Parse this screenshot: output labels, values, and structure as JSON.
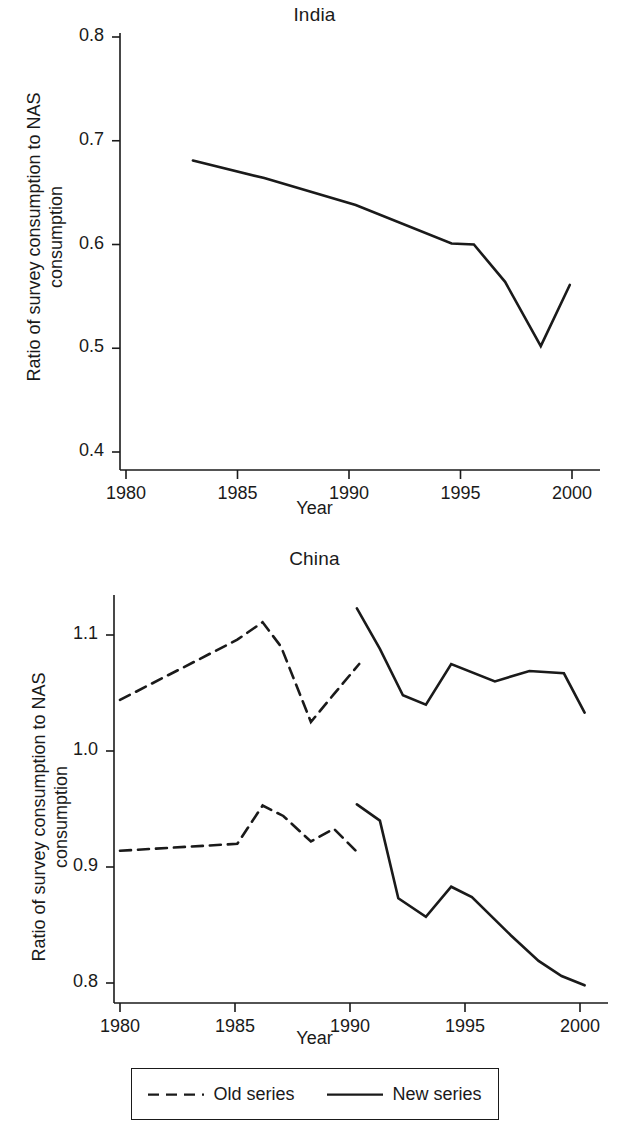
{
  "figure": {
    "ylabel": "Ratio of survey consumption to NAS\nconsumption",
    "xlabel": "Year",
    "axis_color": "#1a1a1a",
    "background": "#ffffff"
  },
  "legend": {
    "entries": [
      {
        "label": "Old series",
        "style": "dashed",
        "swatch": "dashed-line-swatch"
      },
      {
        "label": "New series",
        "style": "solid",
        "swatch": "solid-line-swatch"
      }
    ]
  },
  "chart_data": [
    {
      "type": "line",
      "title": "India",
      "xlabel": "Year",
      "ylabel": "Ratio of survey consumption to NAS consumption",
      "xlim": [
        1979.2,
        2000.6
      ],
      "ylim": [
        0.4,
        0.8
      ],
      "xticks": [
        1980,
        1985,
        1990,
        1995,
        2000
      ],
      "xticklabels": [
        "1980",
        "1985",
        "1990",
        "1995",
        "2000"
      ],
      "yticks": [
        0.4,
        0.5,
        0.6,
        0.7,
        0.8
      ],
      "yticklabels": [
        "0.4",
        "0.5",
        "0.6",
        "0.7",
        "0.8"
      ],
      "grid": false,
      "legend": "none",
      "series": [
        {
          "name": "India ratio",
          "style": "solid",
          "x": [
            1983.0,
            1986.2,
            1990.3,
            1994.6,
            1995.6,
            1997.0,
            1998.6,
            1999.9
          ],
          "y": [
            0.681,
            0.664,
            0.638,
            0.601,
            0.6,
            0.564,
            0.502,
            0.561
          ]
        }
      ]
    },
    {
      "type": "line",
      "title": "China",
      "xlabel": "Year",
      "ylabel": "Ratio of survey consumption to NAS consumption",
      "xlim": [
        1979.3,
        2000.6
      ],
      "ylim": [
        0.783,
        1.133
      ],
      "xticks": [
        1980,
        1985,
        1990,
        1995,
        2000
      ],
      "xticklabels": [
        "1980",
        "1985",
        "1990",
        "1995",
        "2000"
      ],
      "yticks": [
        0.8,
        0.9,
        1.0,
        1.1
      ],
      "yticklabels": [
        "0.8",
        "0.9",
        "1.0",
        "1.1"
      ],
      "grid": false,
      "legend": "below-axes",
      "series": [
        {
          "name": "Old series (upper)",
          "style": "dashed",
          "x": [
            1980.0,
            1985.1,
            1986.2,
            1987.0,
            1988.3,
            1989.3,
            1990.4
          ],
          "y": [
            1.044,
            1.096,
            1.111,
            1.09,
            1.025,
            1.049,
            1.075
          ]
        },
        {
          "name": "Old series (lower)",
          "style": "dashed",
          "x": [
            1980.0,
            1985.1,
            1986.2,
            1987.1,
            1988.3,
            1989.3,
            1990.4
          ],
          "y": [
            0.914,
            0.92,
            0.953,
            0.944,
            0.922,
            0.933,
            0.911
          ]
        },
        {
          "name": "New series (upper)",
          "style": "solid",
          "x": [
            1990.3,
            1991.3,
            1992.3,
            1993.3,
            1994.4,
            1996.3,
            1997.8,
            1999.3,
            2000.2
          ],
          "y": [
            1.123,
            1.088,
            1.048,
            1.04,
            1.075,
            1.06,
            1.069,
            1.067,
            1.033
          ]
        },
        {
          "name": "New series (lower)",
          "style": "solid",
          "x": [
            1990.3,
            1991.3,
            1992.1,
            1993.3,
            1994.4,
            1995.3,
            1997.0,
            1998.2,
            1999.2,
            2000.2
          ],
          "y": [
            0.954,
            0.94,
            0.873,
            0.857,
            0.883,
            0.874,
            0.841,
            0.819,
            0.806,
            0.798
          ]
        }
      ]
    }
  ]
}
